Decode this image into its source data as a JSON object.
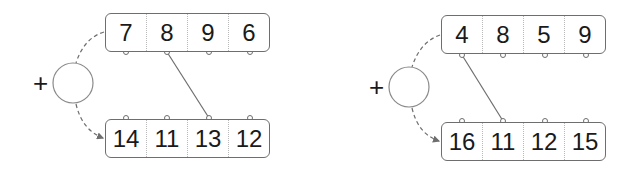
{
  "panels": [
    {
      "operator": "+",
      "top_row": [
        "7",
        "8",
        "9",
        "6"
      ],
      "bottom_row": [
        "14",
        "11",
        "13",
        "12"
      ],
      "link": {
        "from_top_index": 1,
        "to_bottom_index": 2
      }
    },
    {
      "operator": "+",
      "top_row": [
        "4",
        "8",
        "5",
        "9"
      ],
      "bottom_row": [
        "16",
        "11",
        "12",
        "15"
      ],
      "link": {
        "from_top_index": 0,
        "to_bottom_index": 1
      }
    }
  ],
  "colors": {
    "stroke": "#6e6e6e",
    "text": "#1a1a1a",
    "divider": "#b8b8b8"
  }
}
